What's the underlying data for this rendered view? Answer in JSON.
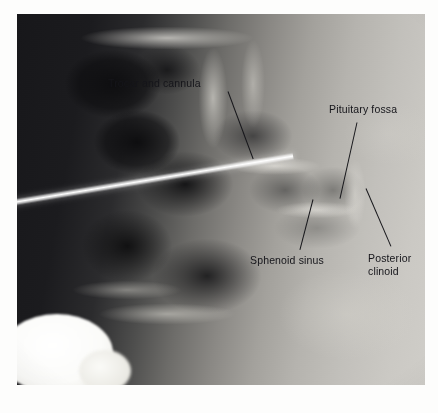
{
  "figure": {
    "kind": "lateral-skull-radiograph",
    "frame": {
      "x": 17,
      "y": 14,
      "width": 408,
      "height": 371
    },
    "page_background": "#fdfdfc"
  },
  "annotations": [
    {
      "id": "trocar-and-cannula",
      "text": "Trocar and cannula",
      "label": {
        "x": 108,
        "y": 77
      },
      "leader": {
        "x1": 228,
        "y1": 91,
        "x2": 253,
        "y2": 158
      }
    },
    {
      "id": "pituitary-fossa",
      "text": "Pituitary fossa",
      "label": {
        "x": 329,
        "y": 103
      },
      "leader": {
        "x1": 357,
        "y1": 122,
        "x2": 340,
        "y2": 198
      }
    },
    {
      "id": "sphenoid-sinus",
      "text": "Sphenoid sinus",
      "label": {
        "x": 250,
        "y": 254
      },
      "leader": {
        "x1": 313,
        "y1": 199,
        "x2": 300,
        "y2": 249
      }
    },
    {
      "id": "posterior-clinoid",
      "text": "Posterior\nclinoid",
      "label": {
        "x": 368,
        "y": 252
      },
      "leader": {
        "x1": 366,
        "y1": 188,
        "x2": 391,
        "y2": 246
      }
    }
  ],
  "colors": {
    "ink": "#15151a",
    "leader": "#17171b",
    "needle": "#ffffff",
    "film_dark": "#17171a",
    "film_light": "#cfcdc8"
  }
}
